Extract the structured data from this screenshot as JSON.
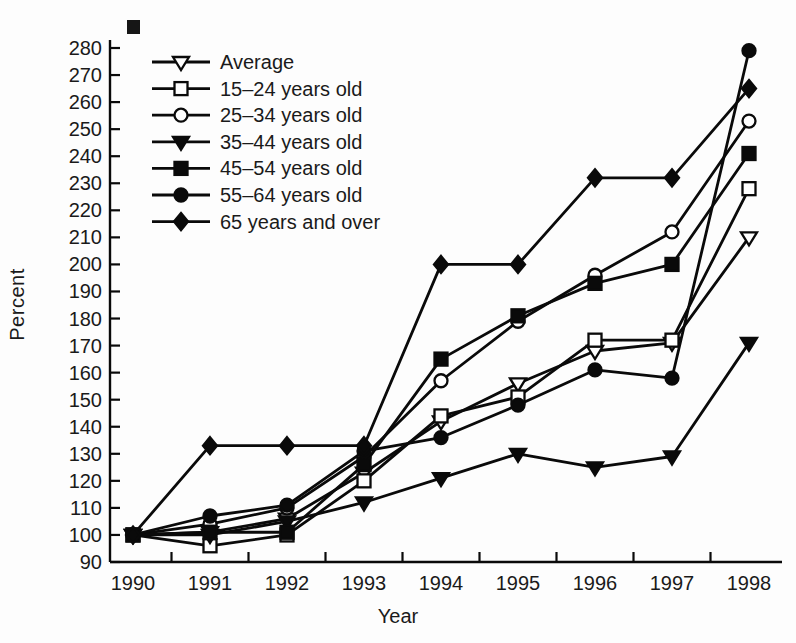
{
  "figure": {
    "ylabel": "Percent",
    "xlabel": "Year"
  },
  "chart_data": {
    "type": "line",
    "title": "",
    "xlabel": "Year",
    "ylabel": "Percent",
    "categories": [
      1990,
      1991,
      1992,
      1993,
      1994,
      1995,
      1996,
      1997,
      1998
    ],
    "ylim": [
      90,
      280
    ],
    "yticks": [
      90,
      100,
      110,
      120,
      130,
      140,
      150,
      160,
      170,
      180,
      190,
      200,
      210,
      220,
      230,
      240,
      250,
      260,
      270,
      280
    ],
    "grid": false,
    "legend_position": "upper-left-inside",
    "line_color": "#0a0a0a",
    "series": [
      {
        "name": "Average",
        "marker": "triangle-down-open",
        "values": [
          100,
          101,
          106,
          123,
          142,
          156,
          168,
          171,
          210
        ]
      },
      {
        "name": "15–24 years old",
        "marker": "square-open",
        "values": [
          100,
          96,
          100,
          120,
          144,
          151,
          172,
          172,
          228
        ]
      },
      {
        "name": "25–34 years old",
        "marker": "circle-open",
        "values": [
          100,
          104,
          110,
          129,
          157,
          179,
          196,
          212,
          253
        ]
      },
      {
        "name": "35–44 years old",
        "marker": "triangle-down-filled",
        "values": [
          100,
          100,
          105,
          112,
          121,
          130,
          125,
          129,
          171
        ]
      },
      {
        "name": "45–54 years old",
        "marker": "square-filled",
        "values": [
          100,
          101,
          101,
          126,
          165,
          181,
          193,
          200,
          241
        ]
      },
      {
        "name": "55–64 years old",
        "marker": "circle-filled",
        "values": [
          100,
          107,
          111,
          131,
          136,
          148,
          161,
          158,
          279
        ]
      },
      {
        "name": "65 years and over",
        "marker": "diamond-filled",
        "values": [
          100,
          133,
          133,
          133,
          200,
          200,
          232,
          232,
          265
        ]
      }
    ]
  }
}
